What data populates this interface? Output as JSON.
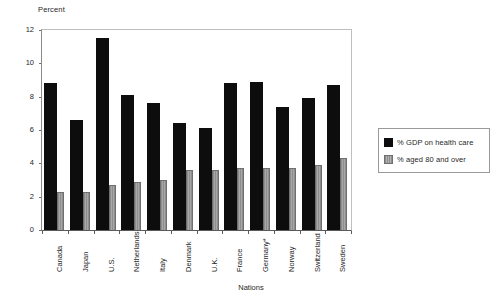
{
  "chart_data": {
    "type": "bar",
    "title": "",
    "xlabel": "Nations",
    "ylabel": "Percent",
    "ylim": [
      0,
      12
    ],
    "yticks": [
      0,
      2,
      4,
      6,
      8,
      10,
      12
    ],
    "grid": false,
    "legend_position": "right",
    "categories": [
      "Canada",
      "Japan",
      "U.S.",
      "Netherlands",
      "Italy",
      "Denmark",
      "U.K.",
      "France",
      "Germany*",
      "Norway",
      "Switzerland",
      "Sweden"
    ],
    "series": [
      {
        "name": "% GDP on health care",
        "color": "#0d0d0d",
        "values": [
          8.8,
          6.6,
          11.5,
          8.1,
          7.6,
          6.4,
          6.1,
          8.8,
          8.9,
          7.4,
          7.9,
          8.7
        ]
      },
      {
        "name": "% aged 80 and over",
        "color": "#9a9a9a",
        "values": [
          2.3,
          2.3,
          2.7,
          2.9,
          3.0,
          3.6,
          3.6,
          3.7,
          3.7,
          3.7,
          3.9,
          4.3
        ]
      }
    ]
  },
  "axes": {
    "y_title": "Percent",
    "x_title": "Nations",
    "y_tick_labels": [
      "0",
      "2",
      "4",
      "6",
      "8",
      "10",
      "12"
    ]
  },
  "legend": {
    "entries": [
      {
        "label": "% GDP on health care",
        "swatch": "dark"
      },
      {
        "label": "% aged 80 and over",
        "swatch": "light"
      }
    ]
  }
}
